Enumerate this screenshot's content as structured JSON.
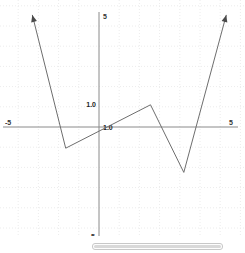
{
  "chart_data": {
    "type": "line",
    "title": "",
    "xlabel": "",
    "ylabel": "",
    "xlim": [
      -5,
      5
    ],
    "ylim": [
      -5,
      5
    ],
    "grid": true,
    "grid_step": 1,
    "legend": "none",
    "axis_endpoint_labels": {
      "x_min": "-5",
      "x_max": "5",
      "y_max": "5",
      "y_min": "-5"
    },
    "origin_tick_labels": {
      "y_unit": "1.0",
      "x_unit": "1.0"
    },
    "series": [
      {
        "name": "piecewise-linear",
        "arrow_start": true,
        "arrow_end": true,
        "points": [
          {
            "x": -3.3,
            "y": 5.55
          },
          {
            "x": -1.65,
            "y": -1.05
          },
          {
            "x": 2.55,
            "y": 1.1
          },
          {
            "x": 4.2,
            "y": -2.25
          },
          {
            "x": 6.3,
            "y": 5.55
          }
        ]
      }
    ]
  },
  "scrollbar": {
    "orientation": "horizontal",
    "position": "bottom"
  }
}
